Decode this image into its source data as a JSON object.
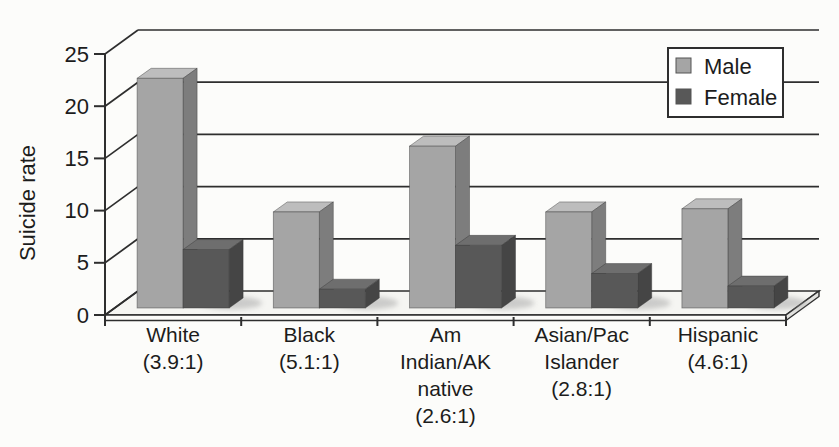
{
  "colors": {
    "background": "#fcfcfa",
    "axis": "#2e2e2e",
    "text": "#1c1c1c",
    "floor_top": "#f5f5f2",
    "floor_front": "#fbfbf9",
    "floor_side": "#e2e2df",
    "legend_bg": "#ffffff",
    "shadow": "#9a9a9a",
    "male": "#a5a5a5",
    "female": "#585858"
  },
  "legend": {
    "position": "top-right",
    "items": [
      {
        "label": "Male",
        "color": "#a5a5a5"
      },
      {
        "label": "Female",
        "color": "#585858"
      }
    ]
  },
  "chart_data": {
    "type": "bar",
    "style": "3d-column",
    "title": "",
    "xlabel": "",
    "ylabel": "Suicide rate",
    "ylim": [
      0,
      25
    ],
    "yticks": [
      0,
      5,
      10,
      15,
      20,
      25
    ],
    "grid": true,
    "legend_position": "top-right",
    "categories": [
      {
        "id": "white",
        "name": "White",
        "label_lines": [
          "White",
          "(3.9:1)"
        ],
        "male_female_ratio": "3.9:1"
      },
      {
        "id": "black",
        "name": "Black",
        "label_lines": [
          "Black",
          "(5.1:1)"
        ],
        "male_female_ratio": "5.1:1"
      },
      {
        "id": "am-indian-ak-native",
        "name": "Am Indian/AK native",
        "label_lines": [
          "Am",
          "Indian/AK",
          "native",
          "(2.6:1)"
        ],
        "male_female_ratio": "2.6:1"
      },
      {
        "id": "asian-pac-islander",
        "name": "Asian/Pac Islander",
        "label_lines": [
          "Asian/Pac",
          "Islander",
          "(2.8:1)"
        ],
        "male_female_ratio": "2.8:1"
      },
      {
        "id": "hispanic",
        "name": "Hispanic",
        "label_lines": [
          "Hispanic",
          "(4.6:1)"
        ],
        "male_female_ratio": "4.6:1"
      }
    ],
    "series": [
      {
        "name": "Male",
        "values": [
          22.0,
          9.2,
          15.5,
          9.2,
          9.5
        ],
        "color": "#a5a5a5",
        "top_color": "#bdbdbd",
        "side_color": "#7d7d7d"
      },
      {
        "name": "Female",
        "values": [
          5.6,
          1.8,
          6.0,
          3.3,
          2.1
        ],
        "color": "#585858",
        "top_color": "#6e6e6e",
        "side_color": "#454545"
      }
    ]
  }
}
